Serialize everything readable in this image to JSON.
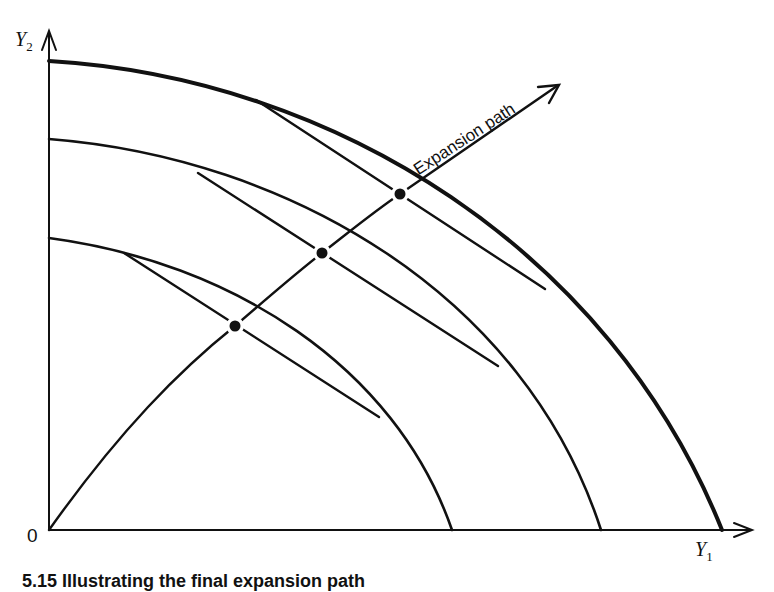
{
  "figure": {
    "y_axis_label": "Y",
    "y_axis_sub": "2",
    "x_axis_label": "Y",
    "x_axis_sub": "1",
    "origin_label": "0",
    "expansion_path_label": "Expansion path",
    "caption_partial": "5.15   Illustrating the final expansion path"
  },
  "colors": {
    "ink": "#111111",
    "background": "#ffffff"
  },
  "curves": [
    {
      "name": "inner-ppf",
      "y_intercept_px": 238,
      "x_intercept_px": 452
    },
    {
      "name": "middle-ppf",
      "y_intercept_px": 139,
      "x_intercept_px": 601
    },
    {
      "name": "outer-ppf",
      "y_intercept_px": 61,
      "x_intercept_px": 722
    }
  ],
  "tangency_points": [
    {
      "x": 235,
      "y": 326
    },
    {
      "x": 322,
      "y": 253
    },
    {
      "x": 400,
      "y": 194
    }
  ]
}
